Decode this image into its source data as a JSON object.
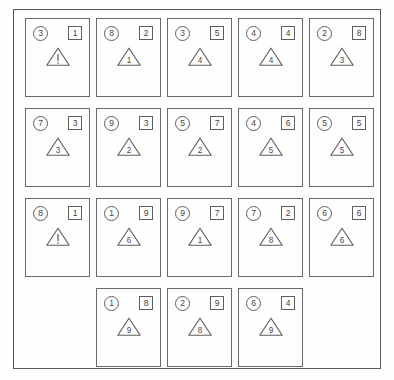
{
  "sheet": {
    "title": "Document card grid",
    "frame_color": "#5a5a5a",
    "card_border_color": "#6a6a6a",
    "text_color": "#444444",
    "background": "#ffffff"
  },
  "grid": {
    "columns": 5,
    "rows": 4,
    "card_count": 18
  },
  "cards": [
    {
      "circle": "3",
      "square": "1",
      "triangle": "!",
      "triangle_style": "bang"
    },
    {
      "circle": "8",
      "square": "2",
      "triangle": "1",
      "triangle_style": "digit"
    },
    {
      "circle": "3",
      "square": "5",
      "triangle": "4",
      "triangle_style": "digit"
    },
    {
      "circle": "4",
      "square": "4",
      "triangle": "4",
      "triangle_style": "digit"
    },
    {
      "circle": "2",
      "square": "8",
      "triangle": "3",
      "triangle_style": "digit"
    },
    {
      "circle": "7",
      "square": "3",
      "triangle": "3",
      "triangle_style": "digit"
    },
    {
      "circle": "9",
      "square": "3",
      "triangle": "2",
      "triangle_style": "digit"
    },
    {
      "circle": "5",
      "square": "7",
      "triangle": "2",
      "triangle_style": "digit"
    },
    {
      "circle": "4",
      "square": "6",
      "triangle": "5",
      "triangle_style": "digit"
    },
    {
      "circle": "5",
      "square": "5",
      "triangle": "5",
      "triangle_style": "digit"
    },
    {
      "circle": "8",
      "square": "1",
      "triangle": "!",
      "triangle_style": "bang"
    },
    {
      "circle": "1",
      "square": "9",
      "triangle": "6",
      "triangle_style": "digit"
    },
    {
      "circle": "9",
      "square": "7",
      "triangle": "1",
      "triangle_style": "digit"
    },
    {
      "circle": "7",
      "square": "2",
      "triangle": "8",
      "triangle_style": "digit"
    },
    {
      "circle": "6",
      "square": "6",
      "triangle": "6",
      "triangle_style": "digit"
    },
    {
      "circle": "",
      "square": "",
      "triangle": "",
      "triangle_style": "none",
      "empty": true
    },
    {
      "circle": "1",
      "square": "8",
      "triangle": "9",
      "triangle_style": "digit"
    },
    {
      "circle": "2",
      "square": "9",
      "triangle": "8",
      "triangle_style": "digit"
    },
    {
      "circle": "6",
      "square": "4",
      "triangle": "9",
      "triangle_style": "digit"
    },
    {
      "circle": "",
      "square": "",
      "triangle": "",
      "triangle_style": "none",
      "empty": true
    }
  ]
}
